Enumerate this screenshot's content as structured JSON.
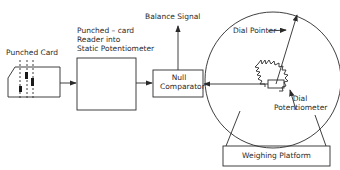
{
  "diagram": {
    "nodes": {
      "punched_card": {
        "label": "Punched Card"
      },
      "card_reader": {
        "label": "Punched – card\nReader into\nStatic Potentiometer"
      },
      "null_comparator": {
        "label": "Null\nComparator"
      },
      "balance_signal": {
        "label": "Balance Signal"
      },
      "dial_pointer": {
        "label": "Dial Pointer"
      },
      "dial_potentiometer": {
        "label": "Dial\nPotentiometer"
      },
      "weighing_platform": {
        "label": "Weighing Platform"
      }
    },
    "edges": [
      {
        "from": "punched_card",
        "to": "card_reader"
      },
      {
        "from": "card_reader",
        "to": "null_comparator"
      },
      {
        "from": "dial_potentiometer",
        "to": "null_comparator"
      },
      {
        "from": "null_comparator",
        "to": "balance_signal"
      },
      {
        "from": "weighing_platform",
        "to": "dial"
      }
    ],
    "colors": {
      "line": "#2a2a2a",
      "background": "#ffffff"
    }
  }
}
